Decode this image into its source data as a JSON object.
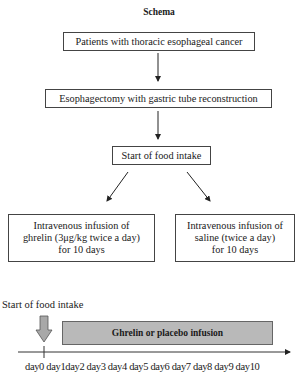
{
  "title": "Schema",
  "flow": {
    "step1": "Patients with thoracic esophageal cancer",
    "step2": "Esophagectomy with gastric tube reconstruction",
    "step3": "Start of food intake",
    "branch_left": {
      "line1": "Intravenous infusion of",
      "line2": "ghrelin (3μg/kg twice a day)",
      "line3": "for 10 days"
    },
    "branch_right": {
      "line1": "Intravenous infusion of",
      "line2": "saline (twice a day)",
      "line3": "for 10 days"
    }
  },
  "timeline": {
    "start_label": "Start of food intake",
    "bar_label": "Ghrelin or placebo infusion",
    "bar_color": "#b9b9b9",
    "days_text": "day0 day1day2 day3 day4 day5 day6 day7 day8 day9 day10",
    "days": [
      "day0",
      "day1",
      "day2",
      "day3",
      "day4",
      "day5",
      "day6",
      "day7",
      "day8",
      "day9",
      "day10"
    ]
  }
}
